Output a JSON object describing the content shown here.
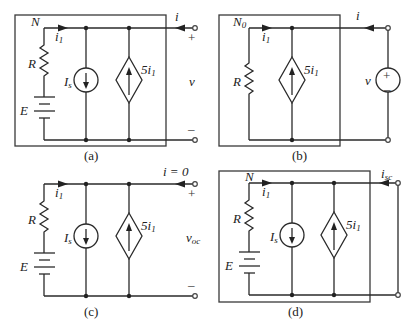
{
  "panels": {
    "a": {
      "caption": "(a)",
      "network_label": "N",
      "branch_current": "i",
      "branch_current_sub": "1",
      "resistor": "R",
      "battery": "E",
      "current_source": "I",
      "current_source_sub": "s",
      "dependent_source": "5i",
      "dependent_source_sub": "1",
      "terminal_current": "i",
      "terminal_voltage": "v",
      "plus": "+",
      "minus": "–"
    },
    "b": {
      "caption": "(b)",
      "network_label": "N",
      "network_label_sub": "0",
      "branch_current": "i",
      "branch_current_sub": "1",
      "resistor": "R",
      "dependent_source": "5i",
      "dependent_source_sub": "1",
      "terminal_current": "i",
      "source_voltage": "v",
      "source_plus": "+",
      "source_minus": "–"
    },
    "c": {
      "caption": "(c)",
      "branch_current": "i",
      "branch_current_sub": "1",
      "resistor": "R",
      "battery": "E",
      "current_source": "I",
      "current_source_sub": "s",
      "dependent_source": "5i",
      "dependent_source_sub": "1",
      "terminal_current": "i = 0",
      "terminal_voltage": "v",
      "terminal_voltage_sub": "oc",
      "plus": "+",
      "minus": "–"
    },
    "d": {
      "caption": "(d)",
      "network_label": "N",
      "branch_current": "i",
      "branch_current_sub": "1",
      "resistor": "R",
      "battery": "E",
      "current_source": "I",
      "current_source_sub": "s",
      "dependent_source": "5i",
      "dependent_source_sub": "1",
      "terminal_current": "i",
      "terminal_current_sub": "sc"
    }
  }
}
